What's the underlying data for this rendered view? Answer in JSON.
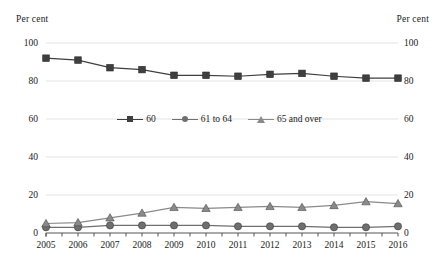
{
  "chart_data": {
    "type": "line",
    "title": "",
    "subtitle": "",
    "xlabel": "",
    "ylabel": "Per cent",
    "ylabel_right": "Per cent",
    "categories": [
      "2005",
      "2006",
      "2007",
      "2008",
      "2009",
      "2010",
      "2011",
      "2012",
      "2013",
      "2014",
      "2015",
      "2016"
    ],
    "ylim": [
      0,
      100
    ],
    "yticks": [
      0,
      20,
      40,
      60,
      80,
      100
    ],
    "xlim_categories": 12,
    "grid": true,
    "grid_axis": "y",
    "legend_position": "center-middle",
    "series": [
      {
        "name": "60",
        "marker": "square",
        "color": "#3f3f3f",
        "values": [
          92,
          91,
          87,
          86,
          83,
          83,
          82.5,
          83.5,
          84,
          82.5,
          81.5,
          81.5
        ]
      },
      {
        "name": "61 to 64",
        "marker": "circle",
        "color": "#6f6f6f",
        "values": [
          3,
          3,
          4,
          4,
          4,
          4,
          3.5,
          3.5,
          3.5,
          3,
          3,
          3.5
        ]
      },
      {
        "name": "65 and over",
        "marker": "triangle",
        "color": "#8a8a8a",
        "values": [
          5,
          5.5,
          8,
          10.5,
          13.5,
          13,
          13.5,
          14,
          13.5,
          14.5,
          16.5,
          15.5
        ]
      }
    ]
  },
  "axis": {
    "unit_left": "Per cent",
    "unit_right": "Per cent",
    "ytick_labels": [
      "0",
      "20",
      "40",
      "60",
      "80",
      "100"
    ],
    "xtick_labels": [
      "2005",
      "2006",
      "2007",
      "2008",
      "2009",
      "2010",
      "2011",
      "2012",
      "2013",
      "2014",
      "2015",
      "2016"
    ]
  },
  "legend": {
    "items": [
      {
        "label": "60"
      },
      {
        "label": "61 to 64"
      },
      {
        "label": "65 and over"
      }
    ]
  },
  "colors": {
    "series_60": "#3f3f3f",
    "series_61_64": "#6f6f6f",
    "series_65_over": "#8a8a8a",
    "grid": "#e3e3e3",
    "axis": "#555555",
    "text": "#1a1a1a",
    "background": "#ffffff"
  }
}
